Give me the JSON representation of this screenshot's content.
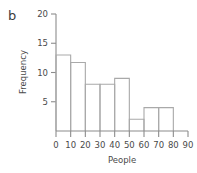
{
  "panel": {
    "label": "b"
  },
  "chart_data": {
    "type": "bar",
    "title": "",
    "subtitle": "",
    "xlabel": "People",
    "ylabel": "Frequency",
    "categories": [
      "0-10",
      "10-20",
      "20-30",
      "30-40",
      "40-50",
      "50-60",
      "60-70",
      "70-80"
    ],
    "bin_edges": [
      0,
      10,
      20,
      30,
      40,
      50,
      60,
      70,
      80
    ],
    "values": [
      13,
      11.7,
      8,
      8,
      9,
      2,
      4,
      4
    ],
    "bar_style": "outline",
    "xlim": [
      0,
      90
    ],
    "ylim": [
      0,
      20
    ],
    "xticks": [
      0,
      10,
      20,
      30,
      40,
      50,
      60,
      70,
      80,
      90
    ],
    "xtick_labels": [
      "0",
      "10",
      "20",
      "30",
      "40",
      "50",
      "60",
      "70",
      "80",
      "90"
    ],
    "yticks": [
      5,
      10,
      15,
      20
    ],
    "ytick_labels": [
      "5",
      "10",
      "15",
      "20"
    ],
    "grid": false,
    "legend": false,
    "legend_position": "none",
    "colors": {
      "bar_outline": "#a9a9a9",
      "axis": "#8c8c8c",
      "text": "#4a4a4a"
    }
  }
}
